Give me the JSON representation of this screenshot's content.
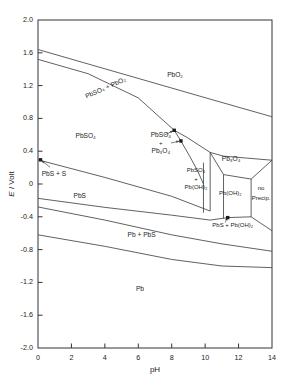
{
  "figure": {
    "kind": "pourbaix-diagram",
    "system": "Pb-S-H2O",
    "axis_line_color": "#333333",
    "curve_color": "#444444",
    "text_color": "#222222"
  },
  "axes": {
    "x": {
      "label": "pH",
      "min": 0,
      "max": 14,
      "ticks": [
        0,
        2,
        4,
        6,
        8,
        10,
        12,
        14
      ],
      "tick_labels": [
        "0",
        "2",
        "4",
        "6",
        "8",
        "10",
        "12",
        "14"
      ]
    },
    "y": {
      "label_parts": {
        "symbol": "E",
        "slash": " / ",
        "unit": "Volt"
      },
      "label": "E / Volt",
      "min": -2.0,
      "max": 2.0,
      "ticks": [
        -2.0,
        -1.6,
        -1.2,
        -0.8,
        -0.4,
        0,
        0.4,
        0.8,
        1.2,
        1.6,
        2.0
      ],
      "tick_labels": [
        "-2.0",
        "-1.6",
        "-1.2",
        "-0.8",
        "-0.4",
        "0",
        "0.4",
        "0.8",
        "1.2",
        "1.6",
        "2.0"
      ]
    }
  },
  "regions": [
    {
      "id": "pbso4-pbo2",
      "text": "PbSO₄ + PbO₂",
      "x": 4.05,
      "y": 1.17,
      "rotate": -24,
      "size": "normal"
    },
    {
      "id": "pbo2",
      "text": "PbO₂",
      "x": 8.2,
      "y": 1.33,
      "rotate": 0,
      "size": "normal"
    },
    {
      "id": "pbso4",
      "text": "PbSO₄",
      "x": 2.85,
      "y": 0.58,
      "rotate": 0,
      "size": "normal"
    },
    {
      "id": "pbso4-pb3o4-line1",
      "text": "PbSO₄",
      "x": 7.35,
      "y": 0.6,
      "rotate": 0,
      "size": "normal"
    },
    {
      "id": "pbso4-pb3o4-plus",
      "text": "+",
      "x": 7.35,
      "y": 0.5,
      "rotate": 0,
      "size": "small"
    },
    {
      "id": "pbso4-pb3o4-line2",
      "text": "Pb₃O₄",
      "x": 7.35,
      "y": 0.4,
      "rotate": 0,
      "size": "normal"
    },
    {
      "id": "pb3o4",
      "text": "Pb₃O₄",
      "x": 11.55,
      "y": 0.3,
      "rotate": 0,
      "size": "normal"
    },
    {
      "id": "pbso4-pboh2-line1",
      "text": "PbSO₄",
      "x": 9.45,
      "y": 0.16,
      "rotate": 0,
      "size": "small"
    },
    {
      "id": "pbso4-pboh2-plus",
      "text": "+",
      "x": 9.45,
      "y": 0.06,
      "rotate": 0,
      "size": "small"
    },
    {
      "id": "pbso4-pboh2-line2",
      "text": "Pb(OH)₂",
      "x": 9.45,
      "y": -0.04,
      "rotate": 0,
      "size": "small"
    },
    {
      "id": "pboh2",
      "text": "Pb(OH)₂",
      "x": 11.5,
      "y": -0.12,
      "rotate": 0,
      "size": "small"
    },
    {
      "id": "no-precip-line1",
      "text": "no",
      "x": 13.35,
      "y": -0.06,
      "rotate": 0,
      "size": "small"
    },
    {
      "id": "no-precip-line2",
      "text": "Precip.",
      "x": 13.35,
      "y": -0.17,
      "rotate": 0,
      "size": "small"
    },
    {
      "id": "pbs-s",
      "text": "PbS + S",
      "x": 0.95,
      "y": 0.12,
      "rotate": 0,
      "size": "normal"
    },
    {
      "id": "pbs",
      "text": "PbS",
      "x": 2.5,
      "y": -0.15,
      "rotate": 0,
      "size": "normal"
    },
    {
      "id": "pb-pbs",
      "text": "Pb + PbS",
      "x": 6.2,
      "y": -0.63,
      "rotate": 0,
      "size": "normal"
    },
    {
      "id": "pbs-pboh2",
      "text": "PbS + Pb(OH)₂",
      "x": 11.65,
      "y": -0.51,
      "rotate": 0,
      "size": "small"
    },
    {
      "id": "pb",
      "text": "Pb",
      "x": 6.1,
      "y": -1.28,
      "rotate": 0,
      "size": "normal"
    }
  ],
  "markers": [
    {
      "id": "marker-pbs-s",
      "x": 0.15,
      "y": 0.295
    },
    {
      "id": "marker-pbso4-pb3o4",
      "x": 8.55,
      "y": 0.525
    },
    {
      "id": "marker-pbso4-pbo2-upper",
      "x": 8.15,
      "y": 0.655
    },
    {
      "id": "marker-pbs-pboh2",
      "x": 11.35,
      "y": -0.41
    }
  ],
  "annotation_arrows": [
    {
      "id": "arrow-pbs-s",
      "from_x": 0.72,
      "from_y": 0.205,
      "to_x": 0.22,
      "to_y": 0.285
    },
    {
      "id": "arrow-pbso4-pb3o4",
      "from_x": 7.95,
      "from_y": 0.5,
      "to_x": 8.45,
      "to_y": 0.522
    },
    {
      "id": "arrow-pbso4-pbo2",
      "from_x": 7.6,
      "from_y": 0.6,
      "to_x": 8.08,
      "to_y": 0.648
    },
    {
      "id": "arrow-pbs-pboh2",
      "from_x": 11.2,
      "from_y": -0.47,
      "to_x": 11.33,
      "to_y": -0.405
    }
  ],
  "chart_data": {
    "type": "line",
    "title": "",
    "xlabel": "pH",
    "ylabel": "E / Volt",
    "xlim": [
      0,
      14
    ],
    "ylim": [
      -2.0,
      2.0
    ],
    "grid": false,
    "legend": "none",
    "series": [
      {
        "name": "O2/H2O upper stability line",
        "comment": "upper boundary of PbSO4+PbO2 band",
        "points": [
          [
            0,
            1.64
          ],
          [
            4,
            1.405
          ],
          [
            8,
            1.17
          ],
          [
            10.3,
            1.035
          ],
          [
            14,
            0.82
          ]
        ]
      },
      {
        "name": "PbSO4/PbO2 lower boundary",
        "points": [
          [
            0,
            1.52
          ],
          [
            3,
            1.345
          ],
          [
            6,
            1.05
          ],
          [
            8.15,
            0.655
          ],
          [
            8.9,
            0.57
          ],
          [
            10.3,
            0.385
          ],
          [
            11.1,
            0.34
          ],
          [
            14,
            0.29
          ]
        ]
      },
      {
        "name": "PbSO4 / PbSO4+Pb3O4 boundary",
        "points": [
          [
            8.15,
            0.655
          ],
          [
            8.55,
            0.525
          ],
          [
            9.1,
            0.33
          ],
          [
            9.55,
            0.16
          ],
          [
            9.9,
            0.0
          ]
        ]
      },
      {
        "name": "Pb3O4 lower boundary",
        "points": [
          [
            10.3,
            0.385
          ],
          [
            11.1,
            0.115
          ],
          [
            12.75,
            0.06
          ],
          [
            14,
            0.29
          ]
        ]
      },
      {
        "name": "PbSO4+Pb(OH)2 left vertical",
        "points": [
          [
            9.9,
            0.26
          ],
          [
            9.9,
            -0.35
          ]
        ]
      },
      {
        "name": "PbSO4+Pb(OH)2 right vertical",
        "points": [
          [
            10.3,
            0.385
          ],
          [
            10.3,
            -0.33
          ]
        ]
      },
      {
        "name": "Pb(OH)2 right vertical",
        "points": [
          [
            11.1,
            0.115
          ],
          [
            11.1,
            -0.42
          ]
        ]
      },
      {
        "name": "no-Precip left vertical",
        "points": [
          [
            12.75,
            0.06
          ],
          [
            12.75,
            -0.4
          ]
        ]
      },
      {
        "name": "PbS+S / PbS boundary",
        "points": [
          [
            0,
            0.295
          ],
          [
            4,
            0.08
          ],
          [
            8,
            -0.15
          ],
          [
            10.3,
            -0.33
          ]
        ]
      },
      {
        "name": "PbS / Pb+PbS boundary",
        "points": [
          [
            0,
            -0.175
          ],
          [
            4,
            -0.285
          ],
          [
            8,
            -0.38
          ],
          [
            10.3,
            -0.44
          ],
          [
            11.35,
            -0.41
          ],
          [
            12.75,
            -0.4
          ],
          [
            14,
            -0.57
          ]
        ]
      },
      {
        "name": "H2/H2O lower stability line",
        "points": [
          [
            0,
            -0.28
          ],
          [
            4,
            -0.44
          ],
          [
            8,
            -0.62
          ],
          [
            11,
            -0.73
          ],
          [
            14,
            -0.82
          ]
        ]
      },
      {
        "name": "Pb+PbS / Pb boundary",
        "points": [
          [
            0,
            -0.62
          ],
          [
            4,
            -0.76
          ],
          [
            8,
            -0.92
          ],
          [
            11,
            -1.0
          ],
          [
            14,
            -1.02
          ]
        ]
      }
    ]
  }
}
